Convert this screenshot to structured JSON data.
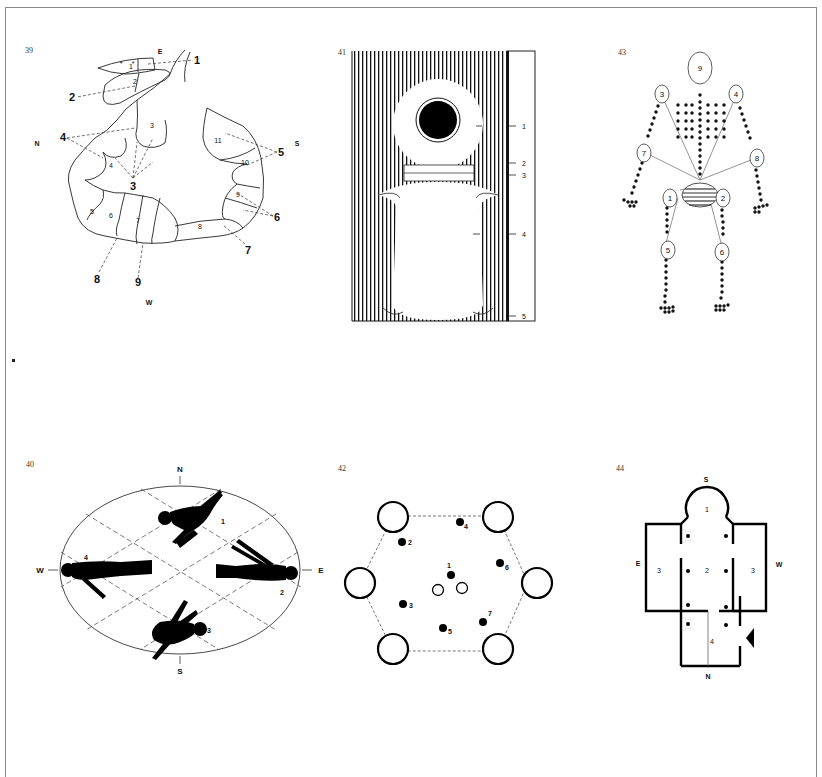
{
  "page": {
    "figures": [
      {
        "number": "39",
        "subject": "serpent-circle",
        "compass": {
          "E": "E",
          "N": "N",
          "S": "S",
          "W": "W"
        },
        "callouts": [
          "1",
          "2",
          "3",
          "4",
          "5",
          "6",
          "7",
          "8",
          "9"
        ],
        "segment_labels": [
          "1",
          "2",
          "3",
          "4",
          "5",
          "6",
          "7",
          "8",
          "9",
          "10",
          "11"
        ]
      },
      {
        "number": "41",
        "subject": "sarcophagus-scale",
        "scale_labels": [
          "1",
          "2",
          "3",
          "4",
          "5"
        ]
      },
      {
        "number": "43",
        "subject": "body-dot-diagram",
        "node_labels": [
          "1",
          "2",
          "3",
          "4",
          "5",
          "6",
          "7",
          "8",
          "9"
        ]
      },
      {
        "number": "40",
        "subject": "four-figures-ellipse",
        "compass": {
          "N": "N",
          "S": "S",
          "E": "E",
          "W": "W"
        },
        "figure_labels": [
          "1",
          "2",
          "3",
          "4"
        ]
      },
      {
        "number": "42",
        "subject": "hexagon-pillars",
        "point_labels": [
          "1",
          "2",
          "3",
          "4",
          "5",
          "6",
          "7"
        ]
      },
      {
        "number": "44",
        "subject": "cruciform-plan",
        "compass": {
          "S": "S",
          "E": "E",
          "W": "W",
          "N": "N"
        },
        "room_labels": [
          "1",
          "2",
          "3",
          "3",
          "4"
        ]
      }
    ]
  }
}
